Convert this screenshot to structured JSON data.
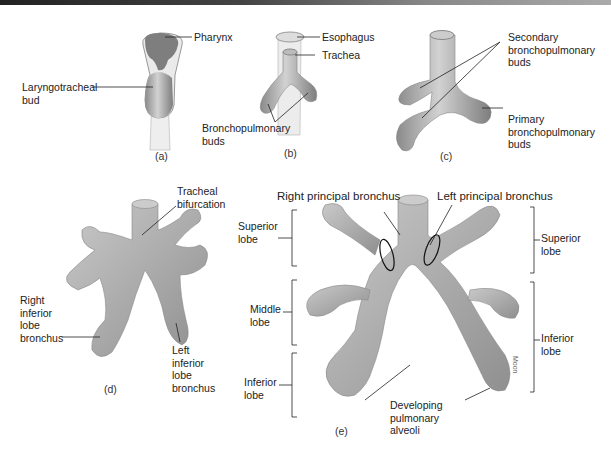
{
  "figure": {
    "panels": [
      {
        "id": "a",
        "caption": "(a)",
        "labels": [
          "Pharynx",
          "Laryngotracheal bud"
        ]
      },
      {
        "id": "b",
        "caption": "(b)",
        "labels": [
          "Esophagus",
          "Trachea",
          "Bronchopulmonary buds"
        ]
      },
      {
        "id": "c",
        "caption": "(c)",
        "labels": [
          "Secondary bronchopulmonary buds",
          "Primary bronchopulmonary buds"
        ]
      },
      {
        "id": "d",
        "caption": "(d)",
        "labels": [
          "Tracheal bifurcation",
          "Right inferior lobe bronchus",
          "Left inferior lobe bronchus"
        ]
      },
      {
        "id": "e",
        "caption": "(e)",
        "labels": [
          "Right principal bronchus",
          "Left principal bronchus",
          "Superior lobe",
          "Middle lobe",
          "Inferior lobe",
          "Developing pulmonary alveoli",
          "Superior lobe",
          "Inferior lobe"
        ]
      }
    ],
    "text": {
      "a_pharynx": "Pharynx",
      "a_bud_1": "Laryngotracheal",
      "a_bud_2": "bud",
      "a_cap": "(a)",
      "b_esoph": "Esophagus",
      "b_trachea": "Trachea",
      "b_buds_1": "Bronchopulmonary",
      "b_buds_2": "buds",
      "b_cap": "(b)",
      "c_sec_1": "Secondary",
      "c_sec_2": "bronchopulmonary",
      "c_sec_3": "buds",
      "c_pri_1": "Primary",
      "c_pri_2": "bronchopulmonary",
      "c_pri_3": "buds",
      "c_cap": "(c)",
      "d_bif_1": "Tracheal",
      "d_bif_2": "bifurcation",
      "d_right_1": "Right",
      "d_right_2": "inferior",
      "d_right_3": "lobe",
      "d_right_4": "bronchus",
      "d_left_1": "Left",
      "d_left_2": "inferior",
      "d_left_3": "lobe",
      "d_left_4": "bronchus",
      "d_cap": "(d)",
      "e_rpb": "Right principal bronchus",
      "e_lpb": "Left principal bronchus",
      "e_rsup_1": "Superior",
      "e_rsup_2": "lobe",
      "e_rmid_1": "Middle",
      "e_rmid_2": "lobe",
      "e_rinf_1": "Inferior",
      "e_rinf_2": "lobe",
      "e_alv_1": "Developing",
      "e_alv_2": "pulmonary",
      "e_alv_3": "alveoli",
      "e_lsup_1": "Superior",
      "e_lsup_2": "lobe",
      "e_linf_1": "Inferior",
      "e_linf_2": "lobe",
      "e_cap": "(e)",
      "credit": "Moon"
    }
  }
}
